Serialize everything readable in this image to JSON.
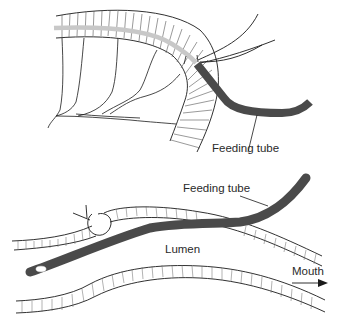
{
  "figure": {
    "top_panel": {
      "label_feeding_tube": "Feeding tube"
    },
    "bottom_panel": {
      "label_feeding_tube": "Feeding tube",
      "label_lumen": "Lumen",
      "label_mouth": "Mouth"
    },
    "colors": {
      "tube": "#4a4a4a",
      "guide_gray": "#c8c8c8",
      "line": "#1a1a1a"
    }
  }
}
